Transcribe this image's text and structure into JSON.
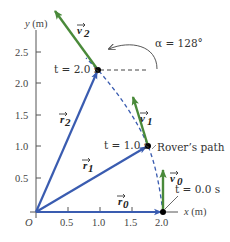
{
  "diagram": {
    "colors": {
      "position_vector": "#3a5cb0",
      "velocity_vector": "#4a8a3a",
      "path": "#3a5cb0",
      "axis": "#444444",
      "point": "#000000"
    },
    "axes": {
      "x_label": "x (m)",
      "y_label": "y (m)",
      "origin_label": "O",
      "x_ticks": [
        "0.5",
        "1.0",
        "1.5",
        "2.0"
      ],
      "y_ticks": [
        "0.5",
        "1.0",
        "1.5",
        "2.0",
        "2.5"
      ]
    },
    "points": [
      {
        "time_label": "t = 0.0 s",
        "x": 2.0,
        "y": 0.0
      },
      {
        "time_label": "t = 1.0 s",
        "x": 1.76,
        "y": 1.05
      },
      {
        "time_label": "t = 2.0 s",
        "x": 1.0,
        "y": 2.2
      }
    ],
    "position_vectors": [
      {
        "label": "r0",
        "display": "r⃗0",
        "sub": "0"
      },
      {
        "label": "r1",
        "display": "r⃗1",
        "sub": "1"
      },
      {
        "label": "r2",
        "display": "r⃗2",
        "sub": "2"
      }
    ],
    "velocity_vectors": [
      {
        "label": "v0",
        "sub": "0"
      },
      {
        "label": "v1",
        "sub": "1"
      },
      {
        "label": "v2",
        "sub": "2"
      }
    ],
    "angle_annotation": "α = 128°",
    "path_label": "Rover’s path"
  }
}
